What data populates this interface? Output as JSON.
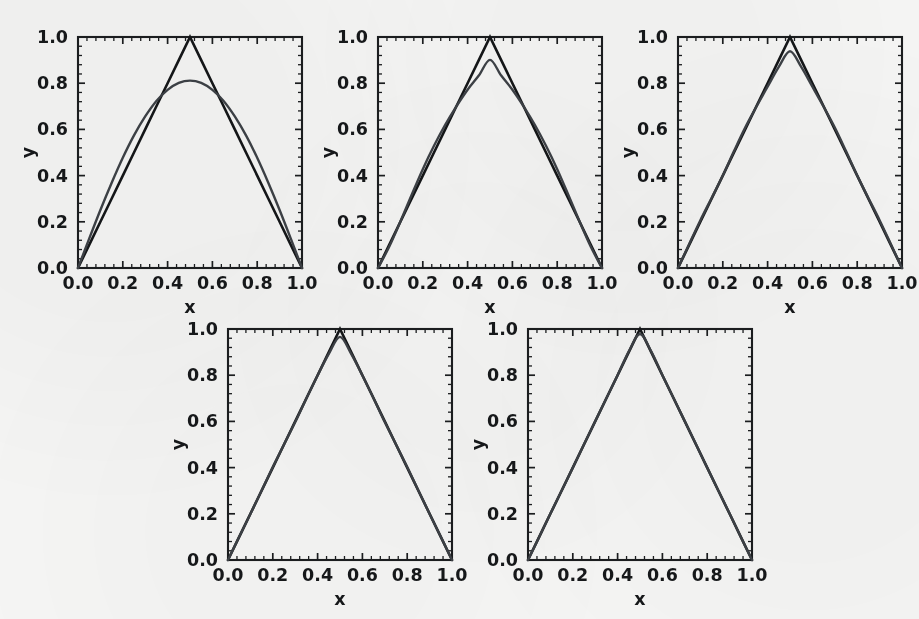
{
  "figure": {
    "title": "",
    "background_color": "#f5f5f4",
    "panel_count": 5,
    "axis_color": "#1b1d1f",
    "exact_curve_color": "#141618",
    "approx_curve_color": "#3d4146"
  },
  "axes": {
    "xlabel": "x",
    "ylabel": "y",
    "xticklabels": [
      "0.0",
      "0.2",
      "0.4",
      "0.6",
      "0.8",
      "1.0"
    ],
    "yticklabels": [
      "0.0",
      "0.2",
      "0.4",
      "0.6",
      "0.8",
      "1.0"
    ],
    "xticks": [
      0,
      0.2,
      0.4,
      0.6,
      0.8,
      1.0
    ],
    "yticks": [
      0,
      0.2,
      0.4,
      0.6,
      0.8,
      1.0
    ],
    "xlim": [
      0,
      1
    ],
    "ylim": [
      0,
      1
    ],
    "minor_ticks_per_interval": 4,
    "grid": false
  },
  "chart_data": [
    {
      "id": "panel-1",
      "type": "line",
      "title": "",
      "xlabel": "x",
      "ylabel": "y",
      "xlim": [
        0,
        1
      ],
      "ylim": [
        0,
        1
      ],
      "grid": false,
      "legend_position": "none",
      "n_terms": 1,
      "peak_value_approx": 0.81,
      "series": [
        {
          "name": "exact tent function",
          "color": "#141618",
          "x": [
            0.0,
            0.05,
            0.1,
            0.15,
            0.2,
            0.25,
            0.3,
            0.35,
            0.4,
            0.45,
            0.5,
            0.55,
            0.6,
            0.65,
            0.7,
            0.75,
            0.8,
            0.85,
            0.9,
            0.95,
            1.0
          ],
          "values": [
            0.0,
            0.1,
            0.2,
            0.3,
            0.4,
            0.5,
            0.6,
            0.7,
            0.8,
            0.9,
            1.0,
            0.9,
            0.8,
            0.7,
            0.6,
            0.5,
            0.4,
            0.3,
            0.2,
            0.1,
            0.0
          ]
        },
        {
          "name": "Fourier approximation (1 term)",
          "color": "#3d4146",
          "x": [
            0.0,
            0.05,
            0.1,
            0.15,
            0.2,
            0.25,
            0.3,
            0.35,
            0.4,
            0.45,
            0.5,
            0.55,
            0.6,
            0.65,
            0.7,
            0.75,
            0.8,
            0.85,
            0.9,
            0.95,
            1.0
          ],
          "values": [
            0.0,
            0.127,
            0.251,
            0.368,
            0.477,
            0.574,
            0.656,
            0.723,
            0.771,
            0.801,
            0.811,
            0.801,
            0.771,
            0.723,
            0.656,
            0.574,
            0.477,
            0.368,
            0.251,
            0.127,
            0.0
          ]
        }
      ]
    },
    {
      "id": "panel-2",
      "type": "line",
      "title": "",
      "xlabel": "x",
      "ylabel": "y",
      "xlim": [
        0,
        1
      ],
      "ylim": [
        0,
        1
      ],
      "grid": false,
      "legend_position": "none",
      "n_terms": 2,
      "peak_value_approx": 0.901,
      "series": [
        {
          "name": "exact tent function",
          "color": "#141618",
          "x": [
            0.0,
            0.05,
            0.1,
            0.15,
            0.2,
            0.25,
            0.3,
            0.35,
            0.4,
            0.45,
            0.5,
            0.55,
            0.6,
            0.65,
            0.7,
            0.75,
            0.8,
            0.85,
            0.9,
            0.95,
            1.0
          ],
          "values": [
            0.0,
            0.1,
            0.2,
            0.3,
            0.4,
            0.5,
            0.6,
            0.7,
            0.8,
            0.9,
            1.0,
            0.9,
            0.8,
            0.7,
            0.6,
            0.5,
            0.4,
            0.3,
            0.2,
            0.1,
            0.0
          ]
        },
        {
          "name": "Fourier approximation (2 terms)",
          "color": "#3d4146",
          "x": [
            0.0,
            0.05,
            0.1,
            0.15,
            0.2,
            0.25,
            0.3,
            0.35,
            0.4,
            0.45,
            0.5,
            0.55,
            0.6,
            0.65,
            0.7,
            0.75,
            0.8,
            0.85,
            0.9,
            0.95,
            1.0
          ],
          "values": [
            0.0,
            0.092,
            0.201,
            0.316,
            0.428,
            0.529,
            0.62,
            0.7,
            0.772,
            0.833,
            0.901,
            0.833,
            0.772,
            0.7,
            0.62,
            0.529,
            0.428,
            0.316,
            0.201,
            0.092,
            0.0
          ]
        }
      ]
    },
    {
      "id": "panel-3",
      "type": "line",
      "title": "",
      "xlabel": "x",
      "ylabel": "y",
      "xlim": [
        0,
        1
      ],
      "ylim": [
        0,
        1
      ],
      "grid": false,
      "legend_position": "none",
      "n_terms": 3,
      "peak_value_approx": 0.938,
      "series": [
        {
          "name": "exact tent function",
          "color": "#141618",
          "x": [
            0.0,
            0.05,
            0.1,
            0.15,
            0.2,
            0.25,
            0.3,
            0.35,
            0.4,
            0.45,
            0.5,
            0.55,
            0.6,
            0.65,
            0.7,
            0.75,
            0.8,
            0.85,
            0.9,
            0.95,
            1.0
          ],
          "values": [
            0.0,
            0.1,
            0.2,
            0.3,
            0.4,
            0.5,
            0.6,
            0.7,
            0.8,
            0.9,
            1.0,
            0.9,
            0.8,
            0.7,
            0.6,
            0.5,
            0.4,
            0.3,
            0.2,
            0.1,
            0.0
          ]
        },
        {
          "name": "Fourier approximation (3 terms)",
          "color": "#3d4146",
          "x": [
            0.0,
            0.05,
            0.1,
            0.15,
            0.2,
            0.25,
            0.3,
            0.35,
            0.4,
            0.45,
            0.5,
            0.55,
            0.6,
            0.65,
            0.7,
            0.75,
            0.8,
            0.85,
            0.9,
            0.95,
            1.0
          ],
          "values": [
            0.0,
            0.104,
            0.207,
            0.303,
            0.4,
            0.506,
            0.608,
            0.698,
            0.785,
            0.871,
            0.938,
            0.871,
            0.785,
            0.698,
            0.608,
            0.506,
            0.4,
            0.303,
            0.207,
            0.104,
            0.0
          ]
        }
      ]
    },
    {
      "id": "panel-4",
      "type": "line",
      "title": "",
      "xlabel": "x",
      "ylabel": "y",
      "xlim": [
        0,
        1
      ],
      "ylim": [
        0,
        1
      ],
      "grid": false,
      "legend_position": "none",
      "n_terms": 4,
      "peak_value_approx": 0.966,
      "series": [
        {
          "name": "exact tent function",
          "color": "#141618",
          "x": [
            0.0,
            0.05,
            0.1,
            0.15,
            0.2,
            0.25,
            0.3,
            0.35,
            0.4,
            0.45,
            0.5,
            0.55,
            0.6,
            0.65,
            0.7,
            0.75,
            0.8,
            0.85,
            0.9,
            0.95,
            1.0
          ],
          "values": [
            0.0,
            0.1,
            0.2,
            0.3,
            0.4,
            0.5,
            0.6,
            0.7,
            0.8,
            0.9,
            1.0,
            0.9,
            0.8,
            0.7,
            0.6,
            0.5,
            0.4,
            0.3,
            0.2,
            0.1,
            0.0
          ]
        },
        {
          "name": "Fourier approximation (4 terms)",
          "color": "#3d4146",
          "x": [
            0.0,
            0.05,
            0.1,
            0.15,
            0.2,
            0.25,
            0.3,
            0.35,
            0.4,
            0.45,
            0.5,
            0.55,
            0.6,
            0.65,
            0.7,
            0.75,
            0.8,
            0.85,
            0.9,
            0.95,
            1.0
          ],
          "values": [
            0.0,
            0.101,
            0.199,
            0.301,
            0.403,
            0.5,
            0.597,
            0.699,
            0.799,
            0.892,
            0.966,
            0.892,
            0.799,
            0.699,
            0.597,
            0.5,
            0.403,
            0.301,
            0.199,
            0.101,
            0.0
          ]
        }
      ]
    },
    {
      "id": "panel-5",
      "type": "line",
      "title": "",
      "xlabel": "x",
      "ylabel": "y",
      "xlim": [
        0,
        1
      ],
      "ylim": [
        0,
        1
      ],
      "grid": false,
      "legend_position": "none",
      "n_terms": 5,
      "peak_value_approx": 0.978,
      "series": [
        {
          "name": "exact tent function",
          "color": "#141618",
          "x": [
            0.0,
            0.05,
            0.1,
            0.15,
            0.2,
            0.25,
            0.3,
            0.35,
            0.4,
            0.45,
            0.5,
            0.55,
            0.6,
            0.65,
            0.7,
            0.75,
            0.8,
            0.85,
            0.9,
            0.95,
            1.0
          ],
          "values": [
            0.0,
            0.1,
            0.2,
            0.3,
            0.4,
            0.5,
            0.6,
            0.7,
            0.8,
            0.9,
            1.0,
            0.9,
            0.8,
            0.7,
            0.6,
            0.5,
            0.4,
            0.3,
            0.2,
            0.1,
            0.0
          ]
        },
        {
          "name": "Fourier approximation (5 terms)",
          "color": "#3d4146",
          "x": [
            0.0,
            0.05,
            0.1,
            0.15,
            0.2,
            0.25,
            0.3,
            0.35,
            0.4,
            0.45,
            0.5,
            0.55,
            0.6,
            0.65,
            0.7,
            0.75,
            0.8,
            0.85,
            0.9,
            0.95,
            1.0
          ],
          "values": [
            0.0,
            0.1,
            0.201,
            0.3,
            0.399,
            0.501,
            0.601,
            0.7,
            0.8,
            0.903,
            0.978,
            0.903,
            0.8,
            0.7,
            0.601,
            0.501,
            0.399,
            0.3,
            0.201,
            0.1,
            0.0
          ]
        }
      ]
    }
  ],
  "panel_geometry": [
    {
      "id": "panel-1",
      "left": 16,
      "top": 14
    },
    {
      "id": "panel-2",
      "left": 316,
      "top": 14
    },
    {
      "id": "panel-3",
      "left": 616,
      "top": 14
    },
    {
      "id": "panel-4",
      "left": 166,
      "top": 306
    },
    {
      "id": "panel-5",
      "left": 466,
      "top": 306
    }
  ]
}
